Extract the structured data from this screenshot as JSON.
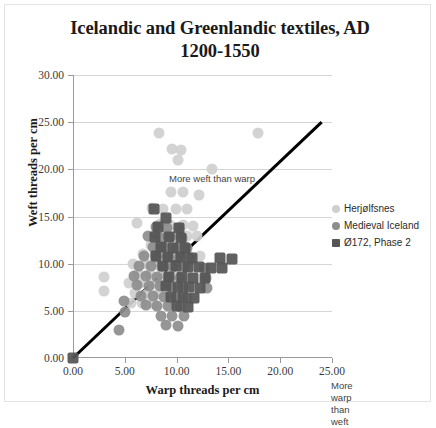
{
  "chart_data": {
    "type": "scatter",
    "title": "Icelandic and Greenlandic textiles, AD 1200-1550",
    "title_line1": "Icelandic and Greenlandic textiles, AD",
    "title_line2": "1200-1550",
    "xlabel": "Warp threads per cm",
    "ylabel": "Weft threads per cm",
    "xlim": [
      0,
      25
    ],
    "ylim": [
      0,
      30
    ],
    "xticks": [
      "0.00",
      "5.00",
      "10.00",
      "15.00",
      "20.00",
      "25.00"
    ],
    "yticks": [
      "0.00",
      "5.00",
      "10.00",
      "15.00",
      "20.00",
      "25.00",
      "30.00"
    ],
    "xtick_values": [
      0,
      5,
      10,
      15,
      20,
      25
    ],
    "ytick_values": [
      0,
      5,
      10,
      15,
      20,
      25,
      30
    ],
    "grid": "horizontal",
    "legend_position": "right",
    "annotations": [
      {
        "name": "more-weft-than-warp",
        "text": "More weft than warp",
        "x": 3.0,
        "y": 27.0
      },
      {
        "name": "more-warp-than-weft",
        "text": "More warp\nthan weft",
        "x": 18.8,
        "y": 5.6
      }
    ],
    "reference_line": {
      "name": "equal-warp-weft-line",
      "label": "y = x",
      "x": [
        0,
        24
      ],
      "y": [
        0,
        25
      ],
      "color": "#000000"
    },
    "series": [
      {
        "name": "Herjølfsnes",
        "marker": "circle",
        "color": "#cfcfcf",
        "points": [
          [
            8.3,
            23.9
          ],
          [
            9.6,
            22.2
          ],
          [
            10.4,
            22.0
          ],
          [
            10.1,
            21.0
          ],
          [
            13.4,
            20.0
          ],
          [
            17.9,
            23.9
          ],
          [
            9.5,
            17.6
          ],
          [
            10.6,
            17.6
          ],
          [
            12.2,
            17.3
          ],
          [
            7.6,
            15.9
          ],
          [
            8.7,
            15.8
          ],
          [
            9.9,
            15.8
          ],
          [
            11.0,
            15.8
          ],
          [
            6.2,
            14.3
          ],
          [
            8.4,
            14.2
          ],
          [
            9.4,
            14.1
          ],
          [
            10.6,
            14.1
          ],
          [
            11.6,
            14.0
          ],
          [
            7.9,
            13.0
          ],
          [
            8.9,
            13.1
          ],
          [
            9.9,
            13.0
          ],
          [
            11.0,
            12.9
          ],
          [
            12.0,
            12.9
          ],
          [
            7.5,
            12.0
          ],
          [
            8.6,
            12.0
          ],
          [
            9.6,
            11.9
          ],
          [
            10.7,
            11.9
          ],
          [
            6.8,
            11.0
          ],
          [
            7.9,
            11.0
          ],
          [
            9.0,
            10.9
          ],
          [
            10.1,
            10.9
          ],
          [
            11.2,
            10.8
          ],
          [
            12.3,
            10.8
          ],
          [
            5.8,
            10.0
          ],
          [
            7.0,
            10.0
          ],
          [
            8.1,
            9.9
          ],
          [
            9.2,
            9.9
          ],
          [
            10.3,
            9.8
          ],
          [
            6.3,
            8.9
          ],
          [
            7.4,
            8.9
          ],
          [
            8.5,
            8.8
          ],
          [
            9.6,
            8.8
          ],
          [
            5.4,
            7.9
          ],
          [
            6.5,
            7.9
          ],
          [
            7.6,
            7.8
          ],
          [
            8.7,
            7.8
          ],
          [
            6.0,
            6.9
          ],
          [
            7.1,
            6.8
          ],
          [
            8.2,
            6.8
          ],
          [
            5.6,
            5.8
          ],
          [
            6.7,
            5.8
          ],
          [
            7.8,
            5.7
          ],
          [
            3.0,
            8.6
          ],
          [
            3.0,
            7.1
          ]
        ]
      },
      {
        "name": "Medieval Iceland",
        "marker": "circle",
        "color": "#8d8d8d",
        "points": [
          [
            8.0,
            13.9
          ],
          [
            9.1,
            13.8
          ],
          [
            10.2,
            13.8
          ],
          [
            7.2,
            12.9
          ],
          [
            8.3,
            12.8
          ],
          [
            9.4,
            12.8
          ],
          [
            10.5,
            12.7
          ],
          [
            7.7,
            11.8
          ],
          [
            8.8,
            11.8
          ],
          [
            9.9,
            11.7
          ],
          [
            11.0,
            11.7
          ],
          [
            6.9,
            10.8
          ],
          [
            8.0,
            10.7
          ],
          [
            9.1,
            10.7
          ],
          [
            10.2,
            10.6
          ],
          [
            11.3,
            10.6
          ],
          [
            6.4,
            9.8
          ],
          [
            7.5,
            9.7
          ],
          [
            8.6,
            9.7
          ],
          [
            9.7,
            9.6
          ],
          [
            10.8,
            9.6
          ],
          [
            12.6,
            9.5
          ],
          [
            5.9,
            8.7
          ],
          [
            7.0,
            8.7
          ],
          [
            8.1,
            8.6
          ],
          [
            9.2,
            8.6
          ],
          [
            10.3,
            8.5
          ],
          [
            12.8,
            8.5
          ],
          [
            6.2,
            7.7
          ],
          [
            7.3,
            7.6
          ],
          [
            8.4,
            7.6
          ],
          [
            9.5,
            7.5
          ],
          [
            10.6,
            7.5
          ],
          [
            12.9,
            7.4
          ],
          [
            6.6,
            6.6
          ],
          [
            7.7,
            6.6
          ],
          [
            8.8,
            6.5
          ],
          [
            9.9,
            6.5
          ],
          [
            11.0,
            6.4
          ],
          [
            7.0,
            5.6
          ],
          [
            8.1,
            5.5
          ],
          [
            9.2,
            5.5
          ],
          [
            10.3,
            5.4
          ],
          [
            8.5,
            4.5
          ],
          [
            9.6,
            4.4
          ],
          [
            10.7,
            4.4
          ],
          [
            9.0,
            3.5
          ],
          [
            10.1,
            3.4
          ],
          [
            4.4,
            3.0
          ],
          [
            4.9,
            6.0
          ],
          [
            5.0,
            4.9
          ]
        ]
      },
      {
        "name": "Ø172, Phase 2",
        "marker": "square",
        "color": "#555555",
        "points": [
          [
            0.0,
            0.0
          ],
          [
            7.8,
            15.8
          ],
          [
            9.0,
            14.8
          ],
          [
            8.2,
            13.9
          ],
          [
            10.2,
            13.8
          ],
          [
            7.9,
            12.8
          ],
          [
            9.3,
            12.8
          ],
          [
            10.4,
            12.7
          ],
          [
            8.5,
            11.8
          ],
          [
            9.7,
            11.7
          ],
          [
            10.8,
            11.7
          ],
          [
            8.0,
            10.8
          ],
          [
            9.2,
            10.7
          ],
          [
            10.4,
            10.7
          ],
          [
            11.5,
            10.6
          ],
          [
            14.2,
            10.6
          ],
          [
            15.3,
            10.5
          ],
          [
            8.7,
            9.7
          ],
          [
            9.9,
            9.7
          ],
          [
            11.1,
            9.6
          ],
          [
            12.2,
            9.6
          ],
          [
            13.3,
            9.5
          ],
          [
            14.4,
            9.5
          ],
          [
            9.3,
            8.6
          ],
          [
            10.5,
            8.6
          ],
          [
            11.6,
            8.5
          ],
          [
            12.7,
            8.5
          ],
          [
            9.0,
            7.6
          ],
          [
            10.1,
            7.5
          ],
          [
            11.2,
            7.5
          ],
          [
            12.3,
            7.4
          ],
          [
            9.5,
            6.5
          ],
          [
            10.6,
            6.5
          ],
          [
            11.7,
            6.4
          ],
          [
            10.0,
            5.5
          ],
          [
            11.1,
            5.4
          ]
        ]
      }
    ]
  },
  "legend": {
    "items": [
      {
        "label": "Herjølfsnes",
        "marker_class": "herj"
      },
      {
        "label": "Medieval Iceland",
        "marker_class": "iceland"
      },
      {
        "label": "Ø172, Phase 2",
        "marker_class": "o172"
      }
    ]
  }
}
